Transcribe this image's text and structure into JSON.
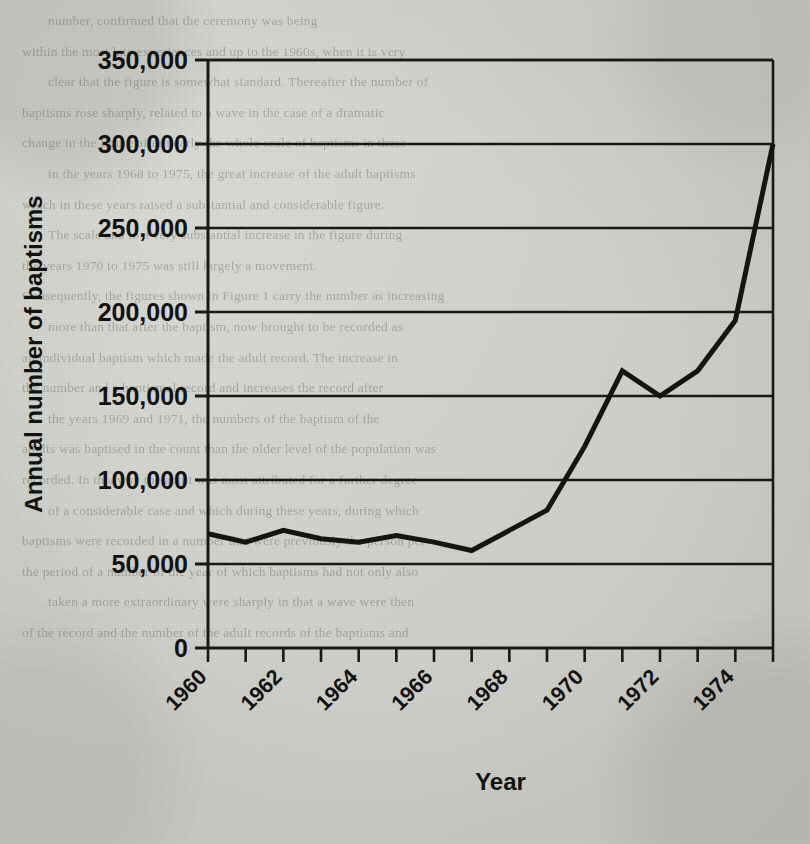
{
  "document": {
    "kind": "scanned-book-page",
    "background_text_lines": [
      "number, confirmed that the ceremony was being",
      "",
      "within the most late experiences and up to the 1960s, when it is very",
      "clear that the figure is somewhat standard. Thereafter the number of",
      "baptisms rose sharply, related to a wave in the case of a dramatic",
      "change in the figure after nearly the whole scale of baptisms in these",
      "in the years 1968 to 1975, the great increase of the adult baptisms",
      "which in these years raised a substantial and considerable figure.",
      "",
      "The scale and to a very substantial increase in the figure during",
      "the years 1970 to 1975 was still largely a movement.",
      "Consequently, the figures shown in Figure 1 carry the number as increasing",
      "more than that after the baptism, now brought to be recorded as",
      "an individual baptism which made the adult record. The increase in",
      "the number and a baptismal record and increases the record after",
      "the years 1969 and 1971, the numbers of the baptism of the",
      "adults was baptised in the count than the older level of the population was",
      "recorded. In this way the adult was most attributed for a further degree",
      "of a considerable case and which during these years, during which",
      "baptisms were recorded in a number that were previously the person per",
      "the period of a number of the year of which baptisms had not only also",
      "taken a more extraordinary were sharply in that a wave were then",
      "of the record and the number of the adult records of the baptisms and"
    ]
  },
  "chart_data": {
    "type": "line",
    "title": "",
    "xlabel": "Year",
    "ylabel": "Annual number of baptisms",
    "xlim": [
      1960,
      1975
    ],
    "ylim": [
      0,
      350000
    ],
    "ytick_values": [
      0,
      50000,
      100000,
      150000,
      200000,
      250000,
      300000,
      350000
    ],
    "ytick_labels": [
      "0",
      "50,000",
      "100,000",
      "150,000",
      "200,000",
      "250,000",
      "300,000",
      "350,000"
    ],
    "xtick_values": [
      1960,
      1961,
      1962,
      1963,
      1964,
      1965,
      1966,
      1967,
      1968,
      1969,
      1970,
      1971,
      1972,
      1973,
      1974,
      1975
    ],
    "xtick_labels_shown": [
      "1960",
      "1962",
      "1964",
      "1966",
      "1968",
      "1970",
      "1972",
      "1974"
    ],
    "xtick_label_values": [
      1960,
      1962,
      1964,
      1966,
      1968,
      1970,
      1972,
      1974
    ],
    "xtick_label_rotation_deg": -45,
    "grid": "horizontal",
    "legend": "none",
    "line_color": "#141412",
    "line_width_px": 5,
    "x": [
      1960,
      1961,
      1962,
      1963,
      1964,
      1965,
      1966,
      1967,
      1968,
      1969,
      1970,
      1971,
      1972,
      1973,
      1974,
      1975
    ],
    "values": [
      68000,
      63000,
      70000,
      65000,
      63000,
      67000,
      63000,
      58000,
      70000,
      82000,
      120000,
      165000,
      150000,
      165000,
      195000,
      300000
    ],
    "series": [
      {
        "name": "Annual number of baptisms",
        "values": [
          68000,
          63000,
          70000,
          65000,
          63000,
          67000,
          63000,
          58000,
          70000,
          82000,
          120000,
          165000,
          150000,
          165000,
          195000,
          300000
        ]
      }
    ]
  },
  "axes_geometry": {
    "plot_left_px": 208,
    "plot_right_px": 773,
    "plot_top_px": 60,
    "plot_bottom_px": 648
  }
}
